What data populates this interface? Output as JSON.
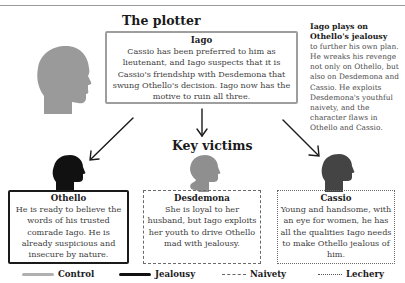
{
  "page": {
    "running_head": "THE MAIN PLOT 7"
  },
  "plotter": {
    "heading": "The plotter",
    "name": "Iago",
    "description": "Cassio has been preferred to him as lieutenant, and Iago suspects that it is Cassio's friendship with Desdemona that swung Othello's decision. Iago now has the motive to ruin all three."
  },
  "side_note": {
    "lead": "Iago plays on Othello's jealousy",
    "body": "to further his own plan. He wreaks his revenge not only on Othello, but also on Desdemona and Cassio. He exploits Desdemona's youthful naivety, and the character flaws in Othello and Cassio."
  },
  "victims": {
    "heading": "Key victims",
    "items": [
      {
        "name": "Othello",
        "description": "He is ready to believe the words of his trusted comrade Iago. He is already suspicious and insecure by nature.",
        "line_style": "Jealousy",
        "head_color": "#111111"
      },
      {
        "name": "Desdemona",
        "description": "She is loyal to her husband, but Iago exploits her youth to drive Othello mad with jealousy.",
        "line_style": "Naivety",
        "head_color": "#8f8f8f"
      },
      {
        "name": "Cassio",
        "description": "Young and handsome, with an eye for women, he has all the qualities Iago needs to make Othello jealous of him.",
        "line_style": "Lechery",
        "head_color": "#444444"
      }
    ]
  },
  "legend": {
    "items": [
      {
        "label": "Control",
        "style": "solid-grey",
        "color": "#b0b0b0"
      },
      {
        "label": "Jealousy",
        "style": "solid-black",
        "color": "#111111"
      },
      {
        "label": "Naivety",
        "style": "dashed",
        "color": "#666666"
      },
      {
        "label": "Lechery",
        "style": "dotted",
        "color": "#555555"
      }
    ]
  },
  "icons": {
    "iago_head": "head-silhouette-icon",
    "othello_head": "head-silhouette-icon",
    "desdemona_head": "female-head-silhouette-icon",
    "cassio_head": "head-silhouette-icon",
    "arrows": "arrow-icon"
  }
}
